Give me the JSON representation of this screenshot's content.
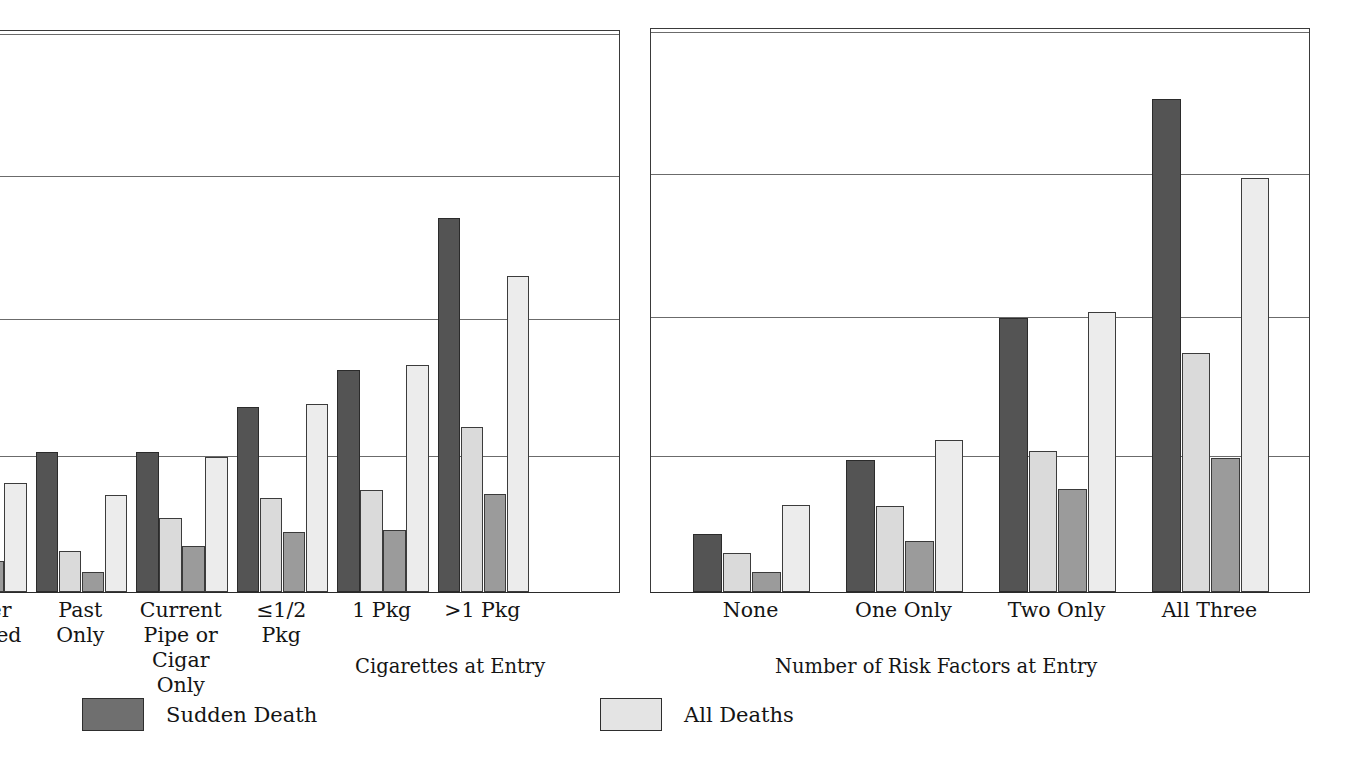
{
  "legend": {
    "items": [
      {
        "label": "Sudden Death",
        "color": "#6f6f6f"
      },
      {
        "label": "All Deaths",
        "color": "#e4e4e4"
      }
    ]
  },
  "chart_data": {
    "type": "bar",
    "title": "",
    "grid": true,
    "legend_position": "bottom",
    "ylim": [
      0,
      4
    ],
    "ylabel": "",
    "series_names": [
      "Sudden Death",
      "All Deaths",
      "Sudden Death",
      "All Deaths"
    ],
    "panels": [
      {
        "name": "cigarettes-panel",
        "xlabel": "Cigarettes at Entry",
        "categories": [
          "Never\nSmoked",
          "Past\nOnly",
          "Current\nPipe or\nCigar\nOnly",
          "≤1/2\nPkg",
          "1 Pkg",
          ">1 Pkg"
        ],
        "series": [
          {
            "name": "Sudden Death",
            "color": "#545454",
            "values": [
              0.83,
              1.0,
              1.0,
              1.32,
              1.58,
              2.67
            ]
          },
          {
            "name": "All Deaths",
            "color": "#dadada",
            "values": [
              0.42,
              0.29,
              0.53,
              0.67,
              0.73,
              1.18
            ]
          },
          {
            "name": "Sudden Death",
            "color": "#9b9b9b",
            "values": [
              0.22,
              0.14,
              0.33,
              0.43,
              0.44,
              0.7
            ]
          },
          {
            "name": "All Deaths",
            "color": "#ececec",
            "values": [
              0.78,
              0.69,
              0.96,
              1.34,
              1.62,
              2.25
            ]
          }
        ]
      },
      {
        "name": "risk-factors-panel",
        "xlabel": "Number of Risk Factors at Entry",
        "categories": [
          "None",
          "One Only",
          "Two Only",
          "All Three"
        ],
        "series": [
          {
            "name": "Sudden Death",
            "color": "#545454",
            "values": [
              0.41,
              0.94,
              1.95,
              3.5
            ]
          },
          {
            "name": "All Deaths",
            "color": "#dadada",
            "values": [
              0.28,
              0.61,
              1.0,
              1.7
            ]
          },
          {
            "name": "Sudden Death",
            "color": "#9b9b9b",
            "values": [
              0.14,
              0.36,
              0.73,
              0.95
            ]
          },
          {
            "name": "All Deaths",
            "color": "#ececec",
            "values": [
              0.62,
              1.08,
              1.99,
              2.94
            ]
          }
        ]
      }
    ],
    "gridline_values": [
      1,
      2,
      3,
      4
    ]
  }
}
